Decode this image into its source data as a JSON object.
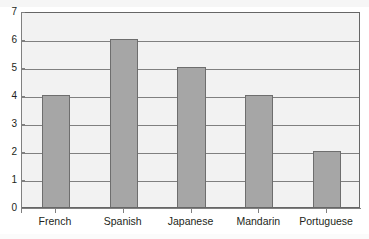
{
  "chart_data": {
    "type": "bar",
    "title": "",
    "subtitle": "",
    "xlabel": "",
    "ylabel": "",
    "categories": [
      "French",
      "Spanish",
      "Japanese",
      "Mandarin",
      "Portuguese"
    ],
    "values": [
      4,
      6,
      5,
      4,
      2
    ],
    "ylim": [
      0,
      7
    ],
    "yticks": [
      0,
      1,
      2,
      3,
      4,
      5,
      6,
      7
    ],
    "ytick_labels": [
      "0",
      "1",
      "2",
      "3",
      "4",
      "5",
      "6",
      "7"
    ],
    "grid": true,
    "grid_axis": "y",
    "legend": false,
    "legend_position": "none",
    "annotations": [],
    "series": [
      {
        "name": "",
        "values": [
          4,
          6,
          5,
          4,
          2
        ]
      }
    ]
  },
  "style": {
    "bar_fill": "#a6a6a6",
    "bar_stroke": "#6e6e6e",
    "plot_background": "#f2f2f2",
    "page_background": "#ffffff",
    "gridline_color": "#808080",
    "axis_color": "#808080",
    "plot_border": "#666666",
    "text_color": "#231f20"
  }
}
